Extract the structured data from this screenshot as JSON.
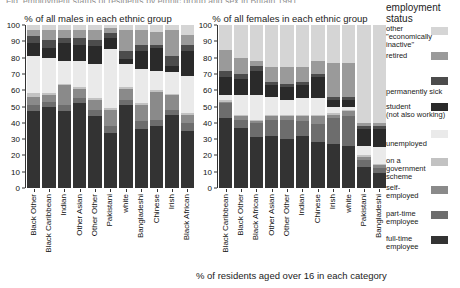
{
  "top_title": "Fig. employment status of residents by ethnic group and sex in Britain 1991",
  "bottom_caption": "% of residents aged over 16 in each category",
  "legend": {
    "title_line1": "employment",
    "title_line2": "status",
    "items": [
      {
        "label": "other\n\"economically\ninactive\"",
        "color": "#d5d5d5",
        "swatch_top": 27,
        "text_top": 25,
        "lines": 3
      },
      {
        "label": "retired",
        "color": "#9a9a9a",
        "swatch_top": 52,
        "text_top": 52,
        "lines": 1
      },
      {
        "label": "permanently sick",
        "color": "#4c4c4c",
        "swatch_top": 77,
        "text_top": 88,
        "lines": 1
      },
      {
        "label": "student\n(not also working)",
        "color": "#2a2a2a",
        "swatch_top": 103,
        "text_top": 103,
        "lines": 2
      },
      {
        "label": "unemployed",
        "color": "#eaeaea",
        "swatch_top": 130,
        "text_top": 140,
        "lines": 1
      },
      {
        "label": "on a\ngovernment\nscheme",
        "color": "#c2c2c2",
        "swatch_top": 158,
        "text_top": 157,
        "lines": 3
      },
      {
        "label": "self-\nemployed",
        "color": "#8a8a8a",
        "swatch_top": 186,
        "text_top": 184,
        "lines": 2
      },
      {
        "label": "part-time\nemployee",
        "color": "#6d6d6d",
        "swatch_top": 211,
        "text_top": 210,
        "lines": 2
      },
      {
        "label": "full-time\nemployee",
        "color": "#333333",
        "swatch_top": 236,
        "text_top": 235,
        "lines": 2
      }
    ]
  },
  "chart_data": [
    {
      "type": "bar",
      "stacked": true,
      "title": "% of all males in each ethnic group",
      "xlabel": "",
      "ylabel": "",
      "ylim": [
        0,
        100
      ],
      "yticks": [
        0,
        10,
        20,
        30,
        40,
        50,
        60,
        70,
        80,
        90,
        100
      ],
      "grid": false,
      "legend_position": "right",
      "categories": [
        "Black Other",
        "Black Caribbean",
        "Indian",
        "Other Asian",
        "Other Other",
        "Pakistani",
        "white",
        "Bangladeshi",
        "Chinese",
        "Irish",
        "Black African"
      ],
      "series": [
        {
          "name": "full-time employee",
          "color": "#333333",
          "values": [
            47,
            50,
            47,
            52,
            44,
            34,
            51,
            36,
            38,
            45,
            35
          ]
        },
        {
          "name": "part-time employee",
          "color": "#6d6d6d",
          "values": [
            4,
            3,
            4,
            3,
            4,
            4,
            3,
            5,
            4,
            3,
            5
          ]
        },
        {
          "name": "self-employed",
          "color": "#8a8a8a",
          "values": [
            5,
            4,
            12,
            6,
            6,
            10,
            7,
            10,
            17,
            9,
            5
          ]
        },
        {
          "name": "on a government scheme",
          "color": "#c2c2c2",
          "values": [
            2,
            1,
            1,
            1,
            1,
            1,
            1,
            1,
            1,
            1,
            1
          ]
        },
        {
          "name": "unemployed",
          "color": "#eaeaea",
          "values": [
            23,
            22,
            14,
            16,
            21,
            36,
            14,
            21,
            12,
            13,
            23
          ]
        },
        {
          "name": "student (not also working)",
          "color": "#2a2a2a",
          "values": [
            8,
            6,
            11,
            10,
            11,
            7,
            3,
            11,
            14,
            4,
            15
          ]
        },
        {
          "name": "permanently sick",
          "color": "#4c4c4c",
          "values": [
            4,
            5,
            3,
            4,
            4,
            3,
            5,
            4,
            2,
            6,
            4
          ]
        },
        {
          "name": "retired",
          "color": "#9a9a9a",
          "values": [
            4,
            6,
            5,
            5,
            6,
            3,
            13,
            9,
            8,
            16,
            6
          ]
        },
        {
          "name": "other \"economically inactive\"",
          "color": "#d5d5d5",
          "values": [
            3,
            3,
            3,
            3,
            3,
            2,
            3,
            3,
            4,
            3,
            6
          ]
        }
      ]
    },
    {
      "type": "bar",
      "stacked": true,
      "title": "% of all females in each ethnic group",
      "xlabel": "% of residents aged over 16 in each category",
      "ylabel": "",
      "ylim": [
        0,
        100
      ],
      "yticks": [
        0,
        10,
        20,
        30,
        40,
        50,
        60,
        70,
        80,
        90,
        100
      ],
      "grid": false,
      "legend_position": "right",
      "categories": [
        "Black Caribbean",
        "Black Other",
        "Black African",
        "Other Asian",
        "Other Other",
        "Indian",
        "Chinese",
        "Irish",
        "white",
        "Pakistani",
        "Bangladeshi"
      ],
      "series": [
        {
          "name": "full-time employee",
          "color": "#333333",
          "values": [
            43,
            37,
            31,
            32,
            30,
            32,
            28,
            27,
            26,
            13,
            9
          ]
        },
        {
          "name": "part-time employee",
          "color": "#6d6d6d",
          "values": [
            9,
            5,
            9,
            10,
            12,
            9,
            11,
            16,
            18,
            4,
            3
          ]
        },
        {
          "name": "self-employed",
          "color": "#8a8a8a",
          "values": [
            1,
            2,
            1,
            2,
            2,
            3,
            5,
            2,
            3,
            2,
            2
          ]
        },
        {
          "name": "on a government scheme",
          "color": "#c2c2c2",
          "values": [
            1,
            1,
            1,
            1,
            1,
            1,
            1,
            1,
            1,
            1,
            1
          ]
        },
        {
          "name": "unemployed",
          "color": "#eaeaea",
          "values": [
            3,
            12,
            15,
            11,
            9,
            10,
            10,
            4,
            2,
            6,
            10
          ]
        },
        {
          "name": "student (not also working)",
          "color": "#2a2a2a",
          "values": [
            11,
            10,
            15,
            7,
            8,
            8,
            13,
            4,
            4,
            10,
            11
          ]
        },
        {
          "name": "permanently sick",
          "color": "#4c4c4c",
          "values": [
            4,
            3,
            3,
            2,
            2,
            2,
            2,
            2,
            2,
            2,
            2
          ]
        },
        {
          "name": "retired",
          "color": "#9a9a9a",
          "values": [
            13,
            10,
            3,
            9,
            10,
            9,
            8,
            21,
            21,
            2,
            2
          ]
        },
        {
          "name": "other \"economically inactive\"",
          "color": "#d5d5d5",
          "values": [
            15,
            20,
            22,
            26,
            26,
            26,
            22,
            23,
            23,
            60,
            60
          ]
        }
      ]
    }
  ]
}
